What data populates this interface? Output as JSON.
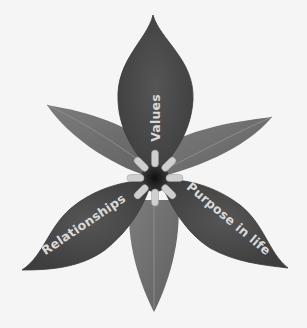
{
  "diagram": {
    "colors": {
      "background": "#f5f5f5",
      "petal": "#4a4a4a",
      "petal_edge": "#3a3a3a",
      "sepal": "#707070",
      "sepal_vein": "#8a8a8a",
      "stamen": "#cfcfcf",
      "center": "#1a1a1a",
      "label": "#d9d9d9"
    },
    "petals": [
      {
        "id": "top",
        "label": "Values"
      },
      {
        "id": "bottom-left",
        "label": "Relationships"
      },
      {
        "id": "bottom-right",
        "label": "Purpose in life"
      }
    ],
    "sepals": [
      {
        "id": "upper-left"
      },
      {
        "id": "upper-right"
      },
      {
        "id": "bottom"
      }
    ],
    "stamen_count": 8
  }
}
